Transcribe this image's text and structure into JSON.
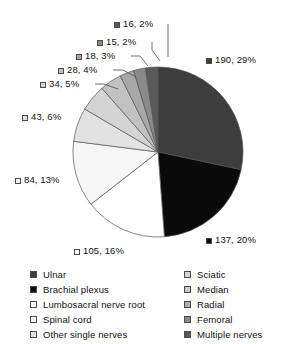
{
  "chart_data": {
    "type": "pie",
    "title": "",
    "subtitle": "",
    "xlabel": "",
    "ylabel": "",
    "total": 670,
    "legend_position": "bottom",
    "grid": false,
    "start_angle_deg": 0,
    "direction": "clockwise",
    "categories": [
      "Ulnar",
      "Brachial plexus",
      "Lumbosacral nerve root",
      "Spinal cord",
      "Other single nerves",
      "Sciatic",
      "Median",
      "Radial",
      "Femoral",
      "Multiple nerves"
    ],
    "values": [
      190,
      137,
      105,
      84,
      43,
      34,
      28,
      18,
      15,
      16
    ],
    "percents": [
      29,
      20,
      16,
      13,
      6,
      5,
      4,
      3,
      2,
      2
    ],
    "colors": [
      "#3d3d3d",
      "#0a0a0a",
      "#ffffff",
      "#f6f6f6",
      "#e2e2e2",
      "#d4d4d4",
      "#c2c2c2",
      "#a8a8a8",
      "#8a8a8a",
      "#5a5a5a"
    ],
    "slices": [
      {
        "label": "190, 29%",
        "value": 190,
        "percent": 29,
        "category": "Ulnar",
        "color": "#3d3d3d"
      },
      {
        "label": "137, 20%",
        "value": 137,
        "percent": 20,
        "category": "Brachial plexus",
        "color": "#0a0a0a"
      },
      {
        "label": "105, 16%",
        "value": 105,
        "percent": 16,
        "category": "Lumbosacral nerve root",
        "color": "#ffffff"
      },
      {
        "label": "84, 13%",
        "value": 84,
        "percent": 13,
        "category": "Spinal cord",
        "color": "#f6f6f6"
      },
      {
        "label": "43, 6%",
        "value": 43,
        "percent": 6,
        "category": "Other single nerves",
        "color": "#e2e2e2"
      },
      {
        "label": "34, 5%",
        "value": 34,
        "percent": 5,
        "category": "Sciatic",
        "color": "#d4d4d4"
      },
      {
        "label": "28, 4%",
        "value": 28,
        "percent": 4,
        "category": "Median",
        "color": "#c2c2c2"
      },
      {
        "label": "18, 3%",
        "value": 18,
        "percent": 3,
        "category": "Radial",
        "color": "#a8a8a8"
      },
      {
        "label": "15, 2%",
        "value": 15,
        "percent": 2,
        "category": "Femoral",
        "color": "#8a8a8a"
      },
      {
        "label": "16, 2%",
        "value": 16,
        "percent": 2,
        "category": "Multiple nerves",
        "color": "#5a5a5a"
      }
    ]
  },
  "labels": {
    "l0": "190, 29%",
    "l1": "137, 20%",
    "l2": "105, 16%",
    "l3": "84, 13%",
    "l4": "43, 6%",
    "l5": "34, 5%",
    "l6": "28, 4%",
    "l7": "18, 3%",
    "l8": "15, 2%",
    "l9": "16, 2%"
  },
  "legend": {
    "left_column": [
      {
        "label": "Ulnar",
        "color": "#3d3d3d"
      },
      {
        "label": "Brachial plexus",
        "color": "#0a0a0a"
      },
      {
        "label": "Lumbosacral nerve root",
        "color": "#ffffff"
      },
      {
        "label": "Spinal cord",
        "color": "#f6f6f6"
      },
      {
        "label": "Other single nerves",
        "color": "#e2e2e2"
      }
    ],
    "right_column": [
      {
        "label": "Sciatic",
        "color": "#d4d4d4"
      },
      {
        "label": "Median",
        "color": "#c9c9c9"
      },
      {
        "label": "Radial",
        "color": "#b0b0b0"
      },
      {
        "label": "Femoral",
        "color": "#8a8a8a"
      },
      {
        "label": "Multiple nerves",
        "color": "#5a5a5a"
      }
    ]
  }
}
